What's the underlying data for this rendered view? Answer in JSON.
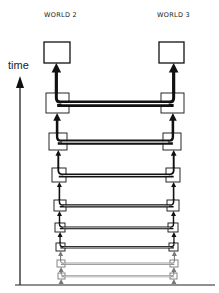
{
  "labels": {
    "world_left": "WORLD 2",
    "world_right": "WORLD 3",
    "axis": "time"
  },
  "colors": {
    "ink": "#111111",
    "faded_ink": "#777777",
    "background": "#ffffff"
  },
  "diagram": {
    "top_boxes": {
      "left": {
        "x": 44,
        "y": 42,
        "w": 26,
        "h": 21
      },
      "right": {
        "x": 159,
        "y": 42,
        "w": 25,
        "h": 21
      }
    },
    "rows": [
      {
        "lx": 46,
        "rx": 161,
        "y": 93,
        "w": 23,
        "h": 20,
        "stroke": 4.0
      },
      {
        "lx": 49,
        "rx": 163,
        "y": 133,
        "w": 18,
        "h": 17,
        "stroke": 3.2
      },
      {
        "lx": 52,
        "rx": 166,
        "y": 168,
        "w": 14,
        "h": 14,
        "stroke": 2.4
      },
      {
        "lx": 54,
        "rx": 167,
        "y": 200,
        "w": 12,
        "h": 11,
        "stroke": 2.0
      },
      {
        "lx": 55,
        "rx": 168,
        "y": 223,
        "w": 10,
        "h": 9,
        "stroke": 1.8
      },
      {
        "lx": 56,
        "rx": 169,
        "y": 243,
        "w": 9,
        "h": 8,
        "stroke": 1.6
      },
      {
        "lx": 57,
        "rx": 170,
        "y": 260,
        "w": 8,
        "h": 7,
        "stroke": 1.3,
        "faded": true
      },
      {
        "lx": 58,
        "rx": 170,
        "y": 273,
        "w": 7,
        "h": 6,
        "stroke": 1.1,
        "faded": true
      }
    ]
  }
}
